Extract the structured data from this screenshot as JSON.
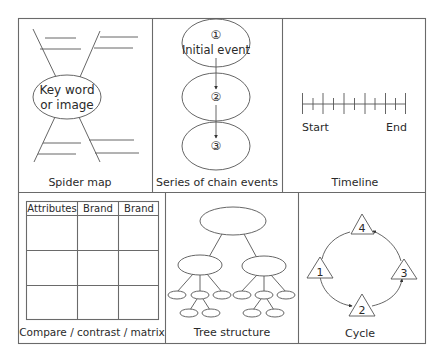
{
  "panels": {
    "spider_map": {
      "caption": "Spider map",
      "center_line1": "Key word",
      "center_line2": "or image"
    },
    "chain_events": {
      "caption": "Series of chain events",
      "steps": [
        {
          "number": "①",
          "label": "Initial event"
        },
        {
          "number": "②",
          "label": ""
        },
        {
          "number": "③",
          "label": ""
        }
      ]
    },
    "timeline": {
      "caption": "Timeline",
      "start_label": "Start",
      "end_label": "End",
      "tick_count": 11
    },
    "matrix": {
      "caption": "Compare / contrast / matrix",
      "headers": [
        "Attributes",
        "Brand",
        "Brand"
      ],
      "body_rows": 3
    },
    "tree": {
      "caption": "Tree structure"
    },
    "cycle": {
      "caption": "Cycle",
      "nodes": [
        "1",
        "2",
        "3",
        "4"
      ]
    }
  }
}
